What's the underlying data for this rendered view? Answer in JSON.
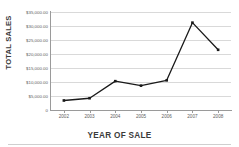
{
  "chart_data": {
    "type": "line",
    "title": "",
    "xlabel": "YEAR OF SALE",
    "ylabel": "TOTAL SALES",
    "categories": [
      "2002",
      "2003",
      "2004",
      "2005",
      "2006",
      "2007",
      "2008"
    ],
    "values": [
      3400,
      4200,
      10300,
      8700,
      10600,
      31200,
      21500
    ],
    "series": [
      {
        "name": "Total Sales",
        "values": [
          3400,
          4200,
          10300,
          8700,
          10600,
          31200,
          21500
        ]
      }
    ],
    "ylim": [
      0,
      35000
    ],
    "ytick_values": [
      0,
      5000,
      10000,
      15000,
      20000,
      25000,
      30000,
      35000
    ],
    "ytick_labels": [
      "0",
      "$5,000.00",
      "$10,000.00",
      "$15,000.00",
      "$20,000.00",
      "$25,000.00",
      "$30,000.00",
      "$35,000.00"
    ],
    "grid": true,
    "legend": "none",
    "marker": "square",
    "line_color": "#1a1a1a",
    "marker_color": "#1a1a1a",
    "grid_color": "#d9d9d9",
    "axis_color": "#9a9a9a"
  }
}
